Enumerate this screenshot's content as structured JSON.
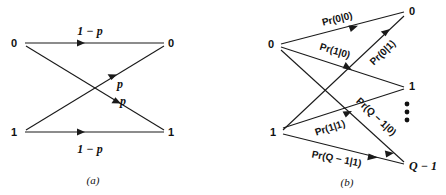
{
  "figure": {
    "type": "diagram",
    "background_color": "#ffffff",
    "line_color": "#1a1a1a",
    "width": 446,
    "height": 195,
    "panels": [
      {
        "id": "a",
        "caption": "(a)",
        "name": "binary-symmetric-channel",
        "input_nodes": [
          {
            "label": "0",
            "x": 14,
            "y": 43
          },
          {
            "label": "1",
            "x": 14,
            "y": 132
          }
        ],
        "output_nodes": [
          {
            "label": "0",
            "x": 170,
            "y": 43
          },
          {
            "label": "1",
            "x": 170,
            "y": 132
          }
        ],
        "edges": [
          {
            "name": "edge-0-to-0",
            "from": "0",
            "to": "0",
            "label": "1 − p",
            "label_x": 90,
            "label_y": 31,
            "rotation": 0
          },
          {
            "name": "edge-1-to-1",
            "from": "1",
            "to": "1",
            "label": "1 − p",
            "label_x": 90,
            "label_y": 150,
            "rotation": 0
          },
          {
            "name": "edge-1-to-0",
            "from": "1",
            "to": "0",
            "label": "p",
            "label_x": 120,
            "label_y": 84,
            "rotation": 0
          },
          {
            "name": "edge-0-to-1",
            "from": "0",
            "to": "1",
            "label": "p",
            "label_x": 123,
            "label_y": 101,
            "rotation": 0
          }
        ]
      },
      {
        "id": "b",
        "caption": "(b)",
        "name": "q-ary-channel",
        "input_nodes": [
          {
            "label": "0",
            "x": 271,
            "y": 44
          },
          {
            "label": "1",
            "x": 273,
            "y": 132
          }
        ],
        "output_nodes": [
          {
            "label": "0",
            "x": 411,
            "y": 11
          },
          {
            "label": "1",
            "x": 411,
            "y": 86
          },
          {
            "label": "Q − 1",
            "x": 409,
            "y": 166
          }
        ],
        "vertical_ellipsis": {
          "name": "vertical-ellipsis",
          "x": 406,
          "y": 110,
          "dots": 3
        },
        "edges": [
          {
            "name": "edge-0-to-0",
            "from": "0",
            "to": "0",
            "label": "Pr(0|0)",
            "label_x": 338,
            "label_y": 19,
            "rotation": 0
          },
          {
            "name": "edge-0-to-1",
            "from": "0",
            "to": "1",
            "label": "Pr(1|0)",
            "label_x": 333,
            "label_y": 51,
            "rotation": 0
          },
          {
            "name": "edge-1-to-0",
            "from": "1",
            "to": "0",
            "label": "Pr(0|1)",
            "label_x": 383,
            "label_y": 56,
            "rotation": -57
          },
          {
            "name": "edge-1-to-1",
            "from": "1",
            "to": "1",
            "label": "Pr(1|1)",
            "label_x": 331,
            "label_y": 128,
            "rotation": 0
          },
          {
            "name": "edge-0-to-qminus1",
            "from": "0",
            "to": "Q − 1",
            "label": "Pr(Q − 1|0)",
            "label_x": 372,
            "label_y": 120,
            "rotation": 55
          },
          {
            "name": "edge-1-to-qminus1",
            "from": "1",
            "to": "Q − 1",
            "label": "Pr(Q − 1|1)",
            "label_x": 334,
            "label_y": 159,
            "rotation": 0
          }
        ]
      }
    ]
  }
}
